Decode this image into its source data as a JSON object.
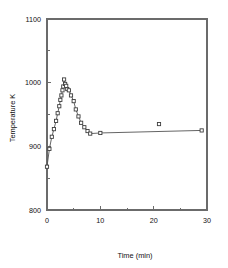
{
  "chart_data": {
    "type": "line",
    "title": "",
    "subtitle": "",
    "xlabel": "Time (min)",
    "ylabel": "Temperature K",
    "xlim": [
      0,
      30
    ],
    "ylim": [
      800,
      1100
    ],
    "xticks": [
      0,
      10,
      20,
      30
    ],
    "xtick_labels": [
      "0",
      "10",
      "20",
      "30"
    ],
    "xminorticks": [
      5,
      15,
      25
    ],
    "yticks": [
      800,
      900,
      1000,
      1100
    ],
    "ytick_labels": [
      "800",
      "900",
      "1000",
      "1100"
    ],
    "yminorticks": [
      850,
      950,
      1050
    ],
    "grid": false,
    "legend": null,
    "marker_style": "open-square",
    "series": [
      {
        "name": "Temperature",
        "x": [
          0.0,
          0.45,
          0.9,
          1.3,
          1.7,
          2.0,
          2.3,
          2.5,
          2.7,
          2.9,
          3.05,
          3.2,
          3.4,
          3.6,
          3.8,
          4.1,
          4.5,
          5.0,
          5.4,
          5.9,
          6.4,
          7.0,
          7.6,
          8.1,
          10.0,
          29.0
        ],
        "y": [
          868,
          896,
          915,
          927,
          940,
          952,
          963,
          973,
          980,
          988,
          994,
          1005,
          998,
          995,
          990,
          988,
          980,
          971,
          958,
          947,
          937,
          930,
          924,
          920,
          921,
          925
        ]
      },
      {
        "name": "Outlier point",
        "x": [
          21.0
        ],
        "y": [
          935
        ]
      }
    ]
  }
}
